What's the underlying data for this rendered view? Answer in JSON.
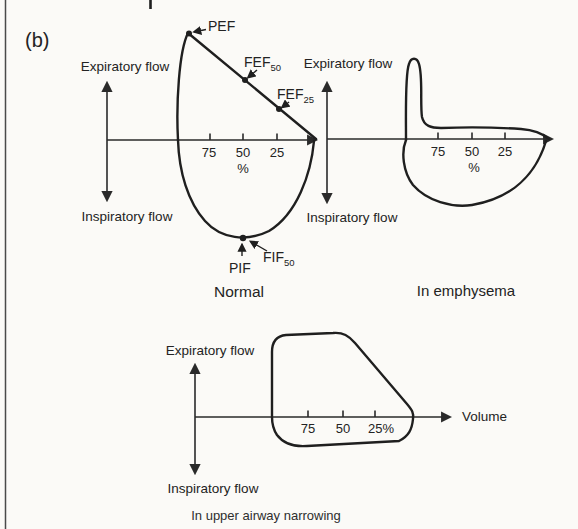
{
  "figure_label": "(b)",
  "colors": {
    "ink": "#1f1f1f",
    "background": "#fbfaf7"
  },
  "charts": {
    "normal": {
      "caption": "Normal",
      "y_top_label": "Expiratory flow",
      "y_bottom_label": "Inspiratory flow",
      "x_ticks": [
        "75",
        "50",
        "25"
      ],
      "x_unit": "%",
      "annotations": {
        "pef": {
          "text": "PEF"
        },
        "fef50": {
          "text": "FEF",
          "sub": "50"
        },
        "fef25": {
          "text": "FEF",
          "sub": "25"
        },
        "pif": {
          "text": "PIF"
        },
        "fif50": {
          "text": "FIF",
          "sub": "50"
        }
      }
    },
    "emphysema": {
      "caption": "In emphysema",
      "y_top_label": "Expiratory flow",
      "y_bottom_label": "Inspiratory flow",
      "x_ticks": [
        "75",
        "50",
        "25"
      ],
      "x_unit": "%"
    },
    "upper_airway": {
      "caption": "In upper airway narrowing",
      "y_top_label": "Expiratory flow",
      "y_bottom_label": "Inspiratory flow",
      "x_axis_label": "Volume",
      "x_ticks": [
        "75",
        "50",
        "25%"
      ]
    }
  }
}
